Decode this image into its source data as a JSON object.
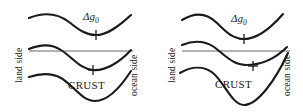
{
  "figure": {
    "type": "diagram",
    "background_color": "#ffffff",
    "curve_color": "#1a1a1a",
    "sealevel_color": "#9a9a9a",
    "panel_count": 2
  },
  "labels": {
    "land_side": "land side",
    "ocean_side": "ocean side",
    "anomaly_symbol": "Δ",
    "anomaly_variable": "g",
    "anomaly_subscript": "0",
    "crust": "CRUST"
  },
  "panels": [
    {
      "id": "panel-left",
      "name": "uncompensated-margin",
      "left_label": "land side",
      "right_label": "ocean side",
      "curves": [
        {
          "name": "gravity-anomaly-curve",
          "label": "Δg₀",
          "description": "free-air gravity anomaly, broad minimum near center",
          "tick": {
            "x": 96,
            "y": 34
          }
        },
        {
          "name": "topography-bathymetry-curve",
          "description": "surface topography descending from land to ocean across the shelf break"
        },
        {
          "name": "sea-level-line",
          "description": "horizontal gray datum line at sea level",
          "y": 51
        },
        {
          "name": "moho-crust-curve",
          "label": "CRUST",
          "description": "crust / Moho boundary with a deep root beneath the margin",
          "tick": {
            "x": 93,
            "y": 70
          }
        }
      ]
    },
    {
      "id": "panel-right",
      "name": "compensated-margin",
      "left_label": "land side",
      "right_label": "ocean side",
      "curves": [
        {
          "name": "gravity-anomaly-curve",
          "label": "Δg₀",
          "description": "free-air gravity anomaly, minimum shifted toward center",
          "tick": {
            "x": 92,
            "y": 38
          }
        },
        {
          "name": "topography-bathymetry-curve",
          "description": "surface topography descending from land to ocean, rising at the right edge"
        },
        {
          "name": "sea-level-line",
          "description": "horizontal gray datum line at sea level",
          "y": 51
        },
        {
          "name": "moho-crust-curve",
          "label": "CRUST",
          "description": "crust / Moho boundary with a pronounced deep root",
          "tick": {
            "x": 101,
            "y": 66
          }
        }
      ]
    }
  ]
}
